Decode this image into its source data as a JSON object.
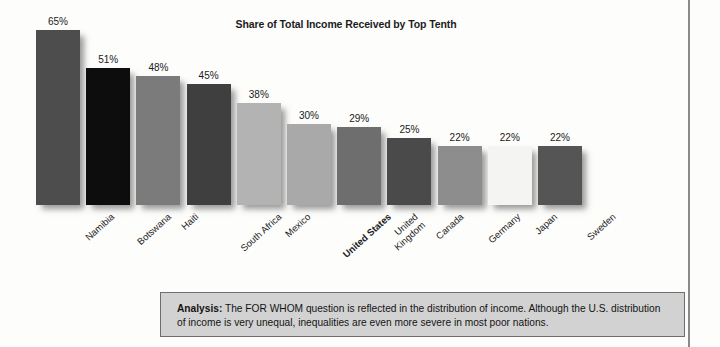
{
  "chart_data": {
    "type": "bar",
    "title": "Share of Total Income Received by Top Tenth",
    "xlabel": "",
    "ylabel": "",
    "ylim": [
      0,
      70
    ],
    "grid": false,
    "legend": null,
    "categories": [
      "Namibia",
      "Botswana",
      "Haiti",
      "South Africa",
      "Mexico",
      "United States",
      "United Kingdom",
      "Canada",
      "Germany",
      "Japan",
      "Sweden"
    ],
    "values": [
      65,
      51,
      48,
      45,
      38,
      30,
      29,
      25,
      22,
      22,
      22
    ],
    "value_labels": [
      "65%",
      "51%",
      "48%",
      "45%",
      "38%",
      "30%",
      "29%",
      "25%",
      "22%",
      "22%",
      "22%"
    ],
    "bar_colors": [
      "#4d4d4d",
      "#0d0d0d",
      "#7b7b7b",
      "#3f3f3f",
      "#b3b3b3",
      "#a9a9a9",
      "#6e6e6e",
      "#4a4a4a",
      "#8d8d8d",
      "#f4f4f2",
      "#555555"
    ],
    "highlighted_category": "United States",
    "category_label_lines": [
      [
        "Namibia"
      ],
      [
        "Botswana"
      ],
      [
        "Haiti"
      ],
      [
        "South Africa"
      ],
      [
        "Mexico"
      ],
      [
        "United States"
      ],
      [
        "United",
        "Kingdom"
      ],
      [
        "Canada"
      ],
      [
        "Germany"
      ],
      [
        "Japan"
      ],
      [
        "Sweden"
      ]
    ]
  },
  "analysis": {
    "label": "Analysis:",
    "body": " The FOR WHOM question is reflected in the distribution of income. Although the U.S. distribution of income is very unequal, inequalities are even more severe in most poor nations."
  },
  "colors": {
    "analysis_box_background": "#d2d2d2",
    "analysis_box_border": "#6e6e6e",
    "frame_rule": "#8a8a8a",
    "page_background": "#fdfdfc",
    "text": "#1a1a1a"
  }
}
